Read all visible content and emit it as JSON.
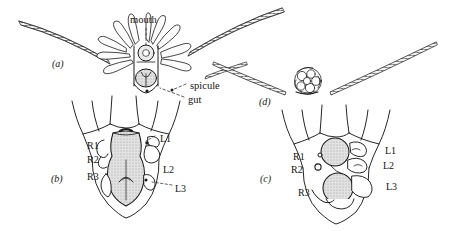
{
  "figure": {
    "kind": "scientific-line-diagram",
    "panels": [
      {
        "id": "a",
        "label": "(a)",
        "x": 52,
        "y": 59
      },
      {
        "id": "b",
        "label": "(b)",
        "x": 51,
        "y": 174
      },
      {
        "id": "c",
        "label": "(c)",
        "x": 260,
        "y": 174
      },
      {
        "id": "d",
        "label": "(d)",
        "x": 259,
        "y": 97
      }
    ],
    "annotations": [
      {
        "name": "mouth",
        "text": "mouth",
        "x": 130,
        "y": 15,
        "panel": "a"
      },
      {
        "name": "spicule",
        "text": "spicule",
        "x": 190,
        "y": 81,
        "panel": "a"
      },
      {
        "name": "gut",
        "text": "gut",
        "x": 188,
        "y": 95,
        "panel": "a"
      }
    ],
    "structure_labels_b": [
      {
        "name": "R1",
        "text": "R1",
        "x": 87,
        "y": 141
      },
      {
        "name": "R2",
        "text": "R2",
        "x": 87,
        "y": 155
      },
      {
        "name": "R3",
        "text": "R3",
        "x": 87,
        "y": 172
      },
      {
        "name": "L1",
        "text": "L1",
        "x": 160,
        "y": 134
      },
      {
        "name": "L2",
        "text": "L2",
        "x": 163,
        "y": 165
      },
      {
        "name": "L3",
        "text": "L3",
        "x": 175,
        "y": 184
      }
    ],
    "structure_labels_c": [
      {
        "name": "R1",
        "text": "R1",
        "x": 293,
        "y": 152
      },
      {
        "name": "R2",
        "text": "R2",
        "x": 291,
        "y": 165
      },
      {
        "name": "R3",
        "text": "R3",
        "x": 298,
        "y": 188
      },
      {
        "name": "L1",
        "text": "L1",
        "x": 385,
        "y": 146
      },
      {
        "name": "L2",
        "text": "L2",
        "x": 383,
        "y": 161
      },
      {
        "name": "L3",
        "text": "L3",
        "x": 386,
        "y": 182
      }
    ],
    "colors": {
      "ink": "#141414",
      "stroke": "#1a1a1a",
      "gut_fill": "#d9d9d9",
      "spicule_fill": "#bdbdbd",
      "background": "#ffffff"
    }
  }
}
